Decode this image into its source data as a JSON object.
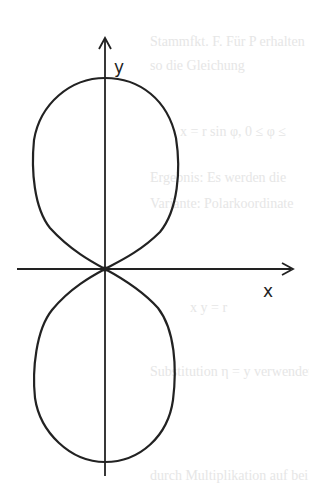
{
  "figure": {
    "axes": {
      "x_label": "x",
      "y_label": "y"
    },
    "colors": {
      "ink": "#222222",
      "background": "#ffffff",
      "bleed_through": "#e6e6e6"
    }
  },
  "bleed_through_text": [
    "Stammfkt. F. Für P erhalten",
    "so die Gleichung",
    "x = r sin φ,  0 ≤ φ ≤",
    "Ergebnis: Es werden die",
    "Variante: Polarkoordinate",
    "x y = r",
    "Substitution η = y verwendet",
    "durch Multiplikation auf bei"
  ]
}
